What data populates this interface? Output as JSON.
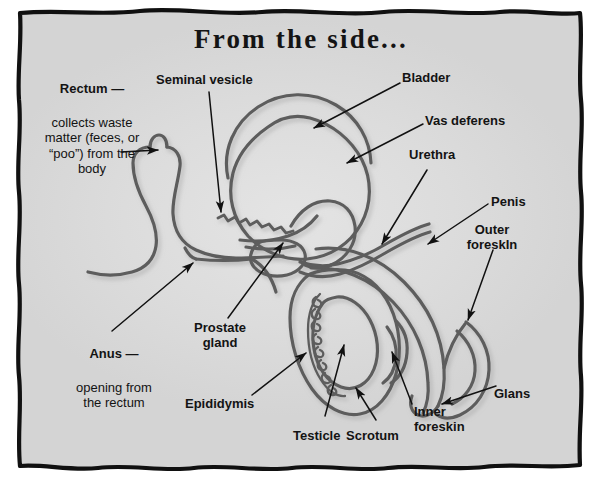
{
  "page": {
    "title": "From the side...",
    "background_color": "#ffffff",
    "panel_color": "#d9d9d9",
    "frame_color": "#111111",
    "ink_color": "#5d5d5d",
    "text_color": "#131313"
  },
  "labels": [
    {
      "id": "rectum",
      "name": "Rectum",
      "head": "Rectum —",
      "body": "collects waste\nmatter (feces, or\n“poo”) from the\nbody",
      "align": "center"
    },
    {
      "id": "seminal-vesicle",
      "name": "Seminal vesicle",
      "head": "Seminal vesicle",
      "body": "",
      "align": "left"
    },
    {
      "id": "bladder",
      "name": "Bladder",
      "head": "Bladder",
      "body": "",
      "align": "left"
    },
    {
      "id": "vas-deferens",
      "name": "Vas deferens",
      "head": "Vas deferens",
      "body": "",
      "align": "left"
    },
    {
      "id": "urethra",
      "name": "Urethra",
      "head": "Urethra",
      "body": "",
      "align": "left"
    },
    {
      "id": "penis",
      "name": "Penis",
      "head": "Penis",
      "body": "",
      "align": "left"
    },
    {
      "id": "outer-foreskin",
      "name": "Outer foreskin",
      "head": "Outer\nforeskIn",
      "body": "",
      "align": "center"
    },
    {
      "id": "glans",
      "name": "Glans",
      "head": "Glans",
      "body": "",
      "align": "left"
    },
    {
      "id": "inner-foreskin",
      "name": "Inner foreskin",
      "head": "Inner\nforeskin",
      "body": "",
      "align": "left"
    },
    {
      "id": "scrotum",
      "name": "Scrotum",
      "head": "Scrotum",
      "body": "",
      "align": "left"
    },
    {
      "id": "testicle",
      "name": "Testicle",
      "head": "Testicle",
      "body": "",
      "align": "left"
    },
    {
      "id": "epididymis",
      "name": "Epididymis",
      "head": "Epididymis",
      "body": "",
      "align": "left"
    },
    {
      "id": "prostate-gland",
      "name": "Prostate gland",
      "head": "Prostate\ngland",
      "body": "",
      "align": "center"
    },
    {
      "id": "anus",
      "name": "Anus",
      "head": "Anus —",
      "body": "opening from\nthe rectum",
      "align": "center"
    }
  ],
  "label_text": {
    "rectum_head": "Rectum —",
    "rectum_body": "collects waste\nmatter (feces, or\n“poo”) from the\nbody",
    "seminal_vesicle": "Seminal vesicle",
    "bladder": "Bladder",
    "vas_deferens": "Vas deferens",
    "urethra": "Urethra",
    "penis": "Penis",
    "outer_foreskin": "Outer\nforeskIn",
    "glans": "Glans",
    "inner_foreskin": "Inner\nforeskin",
    "scrotum": "Scrotum",
    "testicle": "Testicle",
    "epididymis": "Epididymis",
    "prostate_gland": "Prostate\ngland",
    "anus_head": "Anus —",
    "anus_body": "opening from\nthe rectum"
  },
  "anatomy_parts": [
    "rectum",
    "anus",
    "bladder",
    "seminal vesicle",
    "vas deferens",
    "prostate gland",
    "urethra",
    "penis",
    "outer foreskin",
    "inner foreskin",
    "glans",
    "epididymis",
    "testicle",
    "scrotum"
  ]
}
